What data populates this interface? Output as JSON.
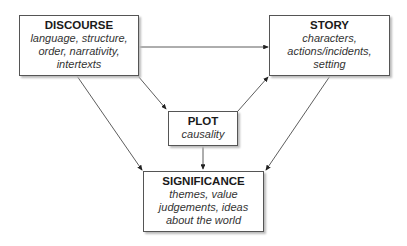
{
  "nodes": {
    "discourse": {
      "title": "DISCOURSE",
      "lines": [
        "language, structure,",
        "order, narrativity,",
        "intertexts"
      ]
    },
    "story": {
      "title": "STORY",
      "lines": [
        "characters,",
        "actions/incidents,",
        "setting"
      ]
    },
    "plot": {
      "title": "PLOT",
      "lines": [
        "causality"
      ]
    },
    "significance": {
      "title": "SIGNIFICANCE",
      "lines": [
        "themes, value",
        "judgements, ideas",
        "about the world"
      ]
    }
  },
  "edges": [
    {
      "from": "discourse",
      "to": "story"
    },
    {
      "from": "discourse",
      "to": "plot"
    },
    {
      "from": "discourse",
      "to": "significance"
    },
    {
      "from": "plot",
      "to": "story"
    },
    {
      "from": "plot",
      "to": "significance"
    },
    {
      "from": "story",
      "to": "significance"
    }
  ]
}
